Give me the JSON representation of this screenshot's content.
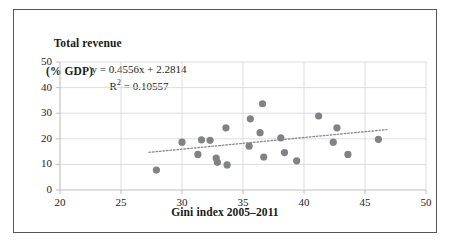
{
  "figure": {
    "border_color": "#56565c",
    "background": "#ffffff"
  },
  "chart_data": {
    "type": "scatter",
    "title": "",
    "xlabel": "Gini index 2005–2011",
    "ylabel_line1": "Total revenue",
    "ylabel_line2": "(% GDP)",
    "xlim": [
      20,
      50
    ],
    "ylim": [
      0,
      50
    ],
    "xticks": [
      20,
      25,
      30,
      35,
      40,
      45,
      50
    ],
    "yticks": [
      0,
      10,
      20,
      30,
      40,
      50
    ],
    "grid": true,
    "legend": "none",
    "marker_color": "#808285",
    "marker_shape": "circle",
    "trendline": {
      "equation": "y = 0.4556x + 2.2814",
      "r_squared_label": "R² = 0.10557",
      "slope": 0.4556,
      "intercept": 2.2814,
      "r_squared": 0.10557,
      "style": "dotted",
      "color": "#8a8a8a",
      "x_start": 27.3,
      "x_end": 46.8
    },
    "points": [
      {
        "x": 27.9,
        "y": 7.8
      },
      {
        "x": 30.0,
        "y": 18.7
      },
      {
        "x": 31.3,
        "y": 13.9
      },
      {
        "x": 31.6,
        "y": 19.6
      },
      {
        "x": 32.3,
        "y": 19.4
      },
      {
        "x": 32.8,
        "y": 12.5
      },
      {
        "x": 32.9,
        "y": 10.8
      },
      {
        "x": 33.6,
        "y": 24.3
      },
      {
        "x": 33.7,
        "y": 9.8
      },
      {
        "x": 35.5,
        "y": 17.1
      },
      {
        "x": 35.6,
        "y": 27.8
      },
      {
        "x": 36.4,
        "y": 22.4
      },
      {
        "x": 36.6,
        "y": 33.7
      },
      {
        "x": 36.7,
        "y": 12.9
      },
      {
        "x": 38.1,
        "y": 20.4
      },
      {
        "x": 38.4,
        "y": 14.6
      },
      {
        "x": 39.4,
        "y": 11.4
      },
      {
        "x": 41.2,
        "y": 28.9
      },
      {
        "x": 42.4,
        "y": 18.7
      },
      {
        "x": 42.7,
        "y": 24.3
      },
      {
        "x": 43.6,
        "y": 13.9
      },
      {
        "x": 46.1,
        "y": 19.8
      }
    ]
  }
}
